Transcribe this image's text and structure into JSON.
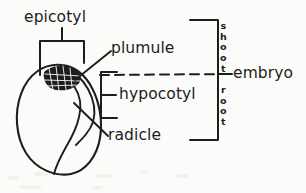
{
  "figure": {
    "style": "hand-drawn line art",
    "ink_color": "#1d1d1d",
    "background_color": "#fbfbf9",
    "width": 306,
    "height": 193
  },
  "labels": {
    "epicotyl": "epicotyl",
    "plumule": "plumule",
    "hypocotyl": "hypocotyl",
    "radicle": "radicle",
    "embryo": "embryo"
  },
  "bracket_labels": {
    "shoot": {
      "text": "shoot",
      "orientation": "vertical-stacked",
      "letters": [
        "s",
        "h",
        "o",
        "o",
        "t"
      ]
    },
    "root": {
      "text": "root",
      "orientation": "vertical-stacked",
      "letters": [
        "r",
        "o",
        "o",
        "t"
      ]
    }
  },
  "parts": [
    {
      "name": "epicotyl",
      "label": "epicotyl",
      "annotation": "bracket above seed apex"
    },
    {
      "name": "plumule",
      "label": "plumule",
      "annotation": "cross-hatched shoot tip inside seed"
    },
    {
      "name": "hypocotyl",
      "label": "hypocotyl",
      "annotation": "bracket with centre tick"
    },
    {
      "name": "radicle",
      "label": "radicle",
      "annotation": "leader line to embryonic root"
    },
    {
      "name": "embryo",
      "label": "embryo",
      "annotation": "large right bracket spanning shoot and root"
    }
  ]
}
